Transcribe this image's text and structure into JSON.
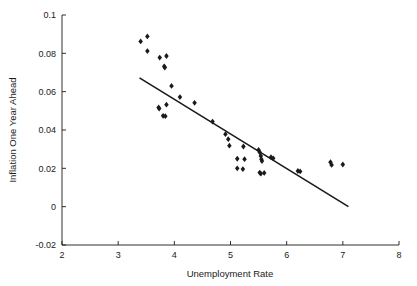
{
  "chart_data": {
    "type": "scatter",
    "title": "",
    "xlabel": "Unemployment Rate",
    "ylabel": "Inflation One Year Ahead",
    "xlim": [
      2,
      8
    ],
    "ylim": [
      -0.02,
      0.1
    ],
    "xticks": [
      2,
      3,
      4,
      5,
      6,
      7,
      8
    ],
    "xticklabels": [
      "2",
      "3",
      "4",
      "5",
      "6",
      "7",
      "8"
    ],
    "yticks": [
      -0.02,
      0,
      0.02,
      0.04,
      0.06,
      0.08,
      0.1
    ],
    "yticklabels": [
      "-0.02",
      "0",
      "0.02",
      "0.04",
      "0.06",
      "0.08",
      "0.1"
    ],
    "grid": false,
    "legend": null,
    "marker": "diamond",
    "marker_color": "#1a1a1a",
    "points": [
      {
        "x": 3.4,
        "y": 0.0862
      },
      {
        "x": 3.52,
        "y": 0.0888
      },
      {
        "x": 3.52,
        "y": 0.0812
      },
      {
        "x": 3.74,
        "y": 0.0778
      },
      {
        "x": 3.86,
        "y": 0.0786
      },
      {
        "x": 3.82,
        "y": 0.0732
      },
      {
        "x": 3.83,
        "y": 0.0726
      },
      {
        "x": 3.95,
        "y": 0.063
      },
      {
        "x": 3.72,
        "y": 0.0518
      },
      {
        "x": 3.73,
        "y": 0.0512
      },
      {
        "x": 3.86,
        "y": 0.0532
      },
      {
        "x": 3.8,
        "y": 0.0474
      },
      {
        "x": 3.84,
        "y": 0.0472
      },
      {
        "x": 4.1,
        "y": 0.0572
      },
      {
        "x": 4.36,
        "y": 0.0542
      },
      {
        "x": 4.68,
        "y": 0.0444
      },
      {
        "x": 4.91,
        "y": 0.0378
      },
      {
        "x": 4.96,
        "y": 0.0352
      },
      {
        "x": 4.98,
        "y": 0.0318
      },
      {
        "x": 5.23,
        "y": 0.0314
      },
      {
        "x": 5.12,
        "y": 0.025
      },
      {
        "x": 5.25,
        "y": 0.0248
      },
      {
        "x": 5.12,
        "y": 0.02
      },
      {
        "x": 5.22,
        "y": 0.0196
      },
      {
        "x": 5.5,
        "y": 0.0296
      },
      {
        "x": 5.52,
        "y": 0.0284
      },
      {
        "x": 5.54,
        "y": 0.0264
      },
      {
        "x": 5.55,
        "y": 0.0248
      },
      {
        "x": 5.56,
        "y": 0.0238
      },
      {
        "x": 5.52,
        "y": 0.0178
      },
      {
        "x": 5.54,
        "y": 0.0172
      },
      {
        "x": 5.6,
        "y": 0.0176
      },
      {
        "x": 5.72,
        "y": 0.0258
      },
      {
        "x": 5.76,
        "y": 0.0252
      },
      {
        "x": 6.2,
        "y": 0.0186
      },
      {
        "x": 6.24,
        "y": 0.0184
      },
      {
        "x": 6.78,
        "y": 0.0232
      },
      {
        "x": 6.8,
        "y": 0.0218
      },
      {
        "x": 7.0,
        "y": 0.022
      }
    ],
    "fit_line": {
      "type": "line",
      "x": [
        3.38,
        7.1
      ],
      "y": [
        0.0672,
        0.0
      ]
    }
  }
}
